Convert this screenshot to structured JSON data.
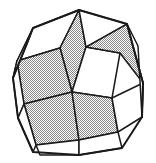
{
  "figure": {
    "kind": "rhombic-zonohedron-line-drawing",
    "silhouette": "decagon",
    "background_color": "#ffffff",
    "edge_color": "#1a1a1a",
    "white_face_color": "#ffffff",
    "shaded_face_color": "#8a8a8a",
    "shaded_face_style": "stipple-checker",
    "edge_width_px": 1.5,
    "outline_width_px": 2,
    "face_count_visible": 15,
    "white_face_count": 8,
    "shaded_face_count": 7,
    "apex_point": [
      79,
      10
    ],
    "center_point": [
      78,
      83
    ],
    "faces": [
      {
        "id": "f01",
        "shade": "white",
        "points": "79,10 33,28 17,61 60,48"
      },
      {
        "id": "f02",
        "shade": "shaded",
        "points": "79,10 60,48 72,92 86,47"
      },
      {
        "id": "f03",
        "shade": "white",
        "points": "79,10 86,47 120,53 127,24"
      },
      {
        "id": "f04",
        "shade": "shaded",
        "points": "60,48 17,61 24,104 72,92"
      },
      {
        "id": "f05",
        "shade": "white",
        "points": "72,92 86,47 120,53 112,98"
      },
      {
        "id": "f06",
        "shade": "shaded",
        "points": "86,47 120,53 143,83 127,24"
      },
      {
        "id": "f07",
        "shade": "white",
        "points": "17,61 13,78 18,118 24,104"
      },
      {
        "id": "f08",
        "shade": "shaded",
        "points": "24,104 72,92 79,140 36,145"
      },
      {
        "id": "f09",
        "shade": "shaded",
        "points": "72,92 112,98 118,132 79,140"
      },
      {
        "id": "f10",
        "shade": "white",
        "points": "112,98 143,83 142,117 118,132"
      },
      {
        "id": "f11",
        "shade": "white",
        "points": "18,118 24,104 36,145 33,152"
      },
      {
        "id": "f12",
        "shade": "white",
        "points": "36,145 79,140 79,155 40,155"
      },
      {
        "id": "f13",
        "shade": "white",
        "points": "79,140 118,132 122,148 79,155"
      },
      {
        "id": "f14",
        "shade": "white",
        "points": "33,28 17,61 13,78 27,44"
      },
      {
        "id": "f15",
        "shade": "white",
        "points": "127,24 143,83 142,117 138,46"
      }
    ],
    "outline": "79,10 33,28 13,78 18,118 33,152 79,155 122,148 142,117 143,83 127,24 79,10"
  }
}
